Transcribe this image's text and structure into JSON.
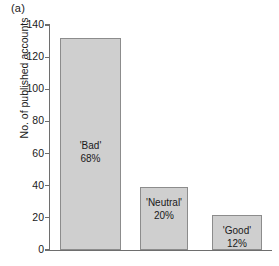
{
  "panel": {
    "label": "(a)"
  },
  "chart_data": {
    "type": "bar",
    "title": "",
    "subtitle": "",
    "xlabel": "",
    "ylabel": "No. of published accounts",
    "ylim": [
      0,
      140
    ],
    "yticks": [
      0,
      20,
      40,
      60,
      80,
      100,
      120,
      140
    ],
    "ytick_labels": [
      "0",
      "20",
      "40",
      "60",
      "80",
      "100",
      "120",
      "140"
    ],
    "grid": false,
    "legend": "none",
    "categories": [
      "'Bad'",
      "'Neutral'",
      "'Good'"
    ],
    "values": [
      132,
      39,
      22
    ],
    "percent_labels": [
      "68%",
      "20%",
      "12%"
    ],
    "bar_fill": "#cfcfcf",
    "bar_edge": "#8c8c8c",
    "axis_color": "#6e6e6e",
    "text_color": "#1a1a1a",
    "annotations": [
      {
        "category": "'Bad'",
        "percent": "68%"
      },
      {
        "category": "'Neutral'",
        "percent": "20%"
      },
      {
        "category": "'Good'",
        "percent": "12%"
      }
    ]
  }
}
